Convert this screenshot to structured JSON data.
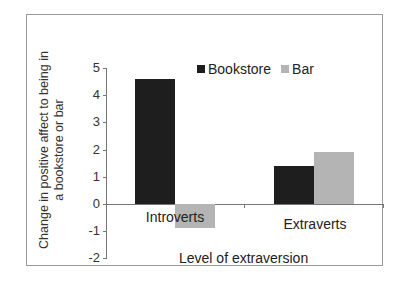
{
  "chart_data": {
    "type": "bar",
    "title": "",
    "xlabel": "Level of extraversion",
    "ylabel": "Change in positive affect to being in a bookstore or bar",
    "ylabel_lines": [
      "Change in positive affect to being in",
      "a bookstore or bar"
    ],
    "categories": [
      "Introverts",
      "Extraverts"
    ],
    "series": [
      {
        "name": "Bookstore",
        "color": "#1e1e1e",
        "values": [
          4.6,
          1.4
        ]
      },
      {
        "name": "Bar",
        "color": "#b4b4b4",
        "values": [
          -0.9,
          1.9
        ]
      }
    ],
    "ylim": [
      -2,
      5
    ],
    "yticks": [
      5,
      4,
      3,
      2,
      1,
      0,
      -1,
      -2
    ],
    "grid": false,
    "legend_position": "top-right inside"
  }
}
